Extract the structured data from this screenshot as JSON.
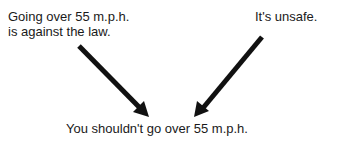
{
  "diagram": {
    "premises": [
      {
        "id": "left",
        "lines": [
          "Going over 55 m.p.h.",
          "is against the law."
        ]
      },
      {
        "id": "right",
        "lines": [
          "It's unsafe."
        ]
      }
    ],
    "conclusion": "You shouldn't go over 55 m.p.h.",
    "arrows": [
      {
        "from": "left",
        "to": "conclusion",
        "icon": "arrow-down-right-icon"
      },
      {
        "from": "right",
        "to": "conclusion",
        "icon": "arrow-down-left-icon"
      }
    ],
    "colors": {
      "text": "#1a1a1a",
      "arrow": "#111111",
      "background": "#ffffff"
    }
  }
}
